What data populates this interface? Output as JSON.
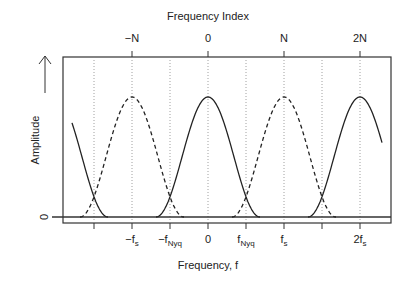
{
  "diagram": {
    "top_axis_title": "Frequency Index",
    "bottom_axis_title": "Frequency, f",
    "y_axis_title": "Amplitude",
    "y_tick_label": "0",
    "top_ticks": [
      {
        "label": "−N",
        "x": 132
      },
      {
        "label": "0",
        "x": 208
      },
      {
        "label": "N",
        "x": 284
      },
      {
        "label": "2N",
        "x": 360
      }
    ],
    "bottom_ticks": [
      {
        "main": "",
        "sub": "",
        "x": 94
      },
      {
        "main": "−f",
        "sub": "s",
        "x": 132
      },
      {
        "main": "−f",
        "sub": "Nyq",
        "x": 170
      },
      {
        "main": "0",
        "sub": "",
        "x": 208
      },
      {
        "main": "f",
        "sub": "Nyq",
        "x": 246
      },
      {
        "main": "f",
        "sub": "s",
        "x": 284
      },
      {
        "main": "",
        "sub": "",
        "x": 322
      },
      {
        "main": "2f",
        "sub": "s",
        "x": 360
      }
    ],
    "curves": {
      "solid_centers": [
        56,
        208,
        360
      ],
      "dashed_centers": [
        132,
        284
      ],
      "half_width": 52,
      "clip_left": 72,
      "clip_right": 382
    },
    "colors": {
      "line": "#222222",
      "grid": "#888888",
      "axis": "#333333"
    }
  }
}
